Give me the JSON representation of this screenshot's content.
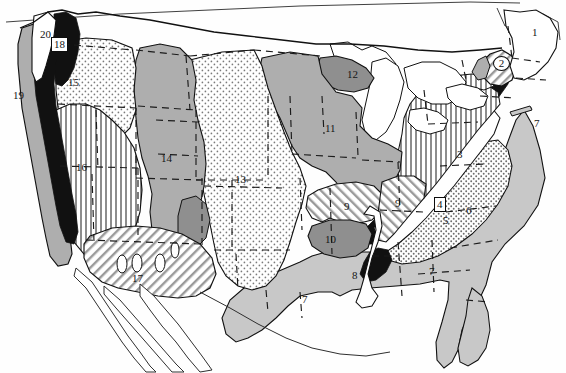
{
  "map": {
    "title": "Physiographic Regions of the United States",
    "type": "physiographic-region-map",
    "projection_note": "conterminous United States with adjacent Mexico and Canada outlines",
    "background_color": "#ffffff",
    "line_color": "#111111",
    "fills": {
      "black": "#111111",
      "dark_gray": "#8f8f8f",
      "mid_gray": "#aeaeae",
      "light_gray": "#c8c8c8",
      "white": "#ffffff",
      "stipple_light": "#f2f2f2",
      "stipple_mid": "#e4e4e4",
      "hatch_vertical": "#ffffff",
      "hatch_diagonal": "#e8e8e8"
    },
    "labels": [
      {
        "id": "region-1",
        "text": "1",
        "x": 535,
        "y": 33,
        "style": "plain",
        "fill": "white",
        "region": "northeast-highlands"
      },
      {
        "id": "region-2",
        "text": "2",
        "x": 501,
        "y": 63,
        "style": "circled",
        "fill": "hatch_diagonal",
        "region": "circled-new-england-upland"
      },
      {
        "id": "region-3",
        "text": "3",
        "x": 460,
        "y": 155,
        "style": "plain",
        "fill": "hatch_vertical",
        "region": "appalachian-plateau"
      },
      {
        "id": "region-4",
        "text": "4",
        "x": 440,
        "y": 204,
        "style": "boxed",
        "fill": "black",
        "region": "blue-ridge"
      },
      {
        "id": "region-5",
        "text": "5",
        "x": 446,
        "y": 221,
        "style": "plain",
        "fill": "white",
        "region": "valley-and-ridge"
      },
      {
        "id": "region-6",
        "text": "6",
        "x": 469,
        "y": 211,
        "style": "plain",
        "fill": "stipple_mid",
        "region": "piedmont"
      },
      {
        "id": "region-7a",
        "text": "7",
        "x": 537,
        "y": 124,
        "style": "plain",
        "fill": "light_gray",
        "region": "atlantic-coastal-plain-leader"
      },
      {
        "id": "region-7b",
        "text": "7",
        "x": 432,
        "y": 272,
        "style": "plain",
        "fill": "light_gray",
        "region": "gulf-coastal-plain-east"
      },
      {
        "id": "region-7c",
        "text": "7",
        "x": 305,
        "y": 300,
        "style": "plain",
        "fill": "light_gray",
        "region": "gulf-coastal-plain-west"
      },
      {
        "id": "region-8",
        "text": "8",
        "x": 355,
        "y": 276,
        "style": "plain",
        "fill": "white",
        "region": "mississippi-alluvial-plain"
      },
      {
        "id": "region-9a",
        "text": "9",
        "x": 347,
        "y": 207,
        "style": "plain",
        "fill": "hatch_diagonal",
        "region": "ozark-plateau"
      },
      {
        "id": "region-9b",
        "text": "9",
        "x": 398,
        "y": 204,
        "style": "plain",
        "fill": "hatch_diagonal",
        "region": "interior-low-plateaus"
      },
      {
        "id": "region-10",
        "text": "10",
        "x": 330,
        "y": 240,
        "style": "plain",
        "fill": "dark_gray",
        "region": "ouachita-province"
      },
      {
        "id": "region-11",
        "text": "11",
        "x": 330,
        "y": 129,
        "style": "plain",
        "fill": "mid_gray",
        "region": "central-lowland"
      },
      {
        "id": "region-12",
        "text": "12",
        "x": 352,
        "y": 75,
        "style": "plain",
        "fill": "dark_gray",
        "region": "superior-upland"
      },
      {
        "id": "region-13",
        "text": "13",
        "x": 239,
        "y": 180,
        "style": "plain",
        "fill": "stipple_light",
        "region": "great-plains"
      },
      {
        "id": "region-14",
        "text": "14",
        "x": 165,
        "y": 159,
        "style": "plain",
        "fill": "mid_gray",
        "region": "rocky-mountains"
      },
      {
        "id": "region-15",
        "text": "15",
        "x": 72,
        "y": 83,
        "style": "plain",
        "fill": "stipple_light",
        "region": "columbia-plateau"
      },
      {
        "id": "region-16",
        "text": "16",
        "x": 80,
        "y": 168,
        "style": "plain",
        "fill": "hatch_vertical",
        "region": "basin-and-range"
      },
      {
        "id": "region-17",
        "text": "17",
        "x": 136,
        "y": 279,
        "style": "plain",
        "fill": "hatch_diagonal",
        "region": "sonoran-desert-section"
      },
      {
        "id": "region-18",
        "text": "18",
        "x": 57,
        "y": 44,
        "style": "boxed",
        "fill": "black",
        "region": "northern-cascades"
      },
      {
        "id": "region-19",
        "text": "19",
        "x": 16,
        "y": 96,
        "style": "plain",
        "fill": "mid_gray",
        "region": "pacific-border-coast-ranges"
      },
      {
        "id": "region-20",
        "text": "20",
        "x": 43,
        "y": 35,
        "style": "plain",
        "fill": "white",
        "region": "puget-trough"
      }
    ]
  }
}
